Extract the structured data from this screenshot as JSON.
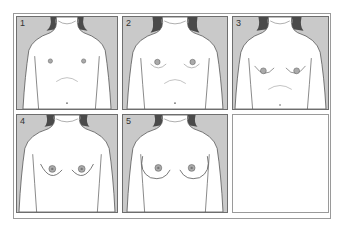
{
  "figure": {
    "title": "",
    "panels": [
      {
        "label": "1",
        "stage": 1,
        "breast": 0,
        "areola": 2.2
      },
      {
        "label": "2",
        "stage": 2,
        "breast": 3,
        "areola": 2.8
      },
      {
        "label": "3",
        "stage": 3,
        "breast": 6,
        "areola": 3
      },
      {
        "label": "4",
        "stage": 4,
        "breast": 9,
        "areola": 3.5
      },
      {
        "label": "5",
        "stage": 5,
        "breast": 12,
        "areola": 3.5
      }
    ],
    "colors": {
      "background": "#c9c9c9",
      "skin": "#ffffff",
      "hair": "#4a4a4a",
      "outline": "#555555"
    }
  }
}
